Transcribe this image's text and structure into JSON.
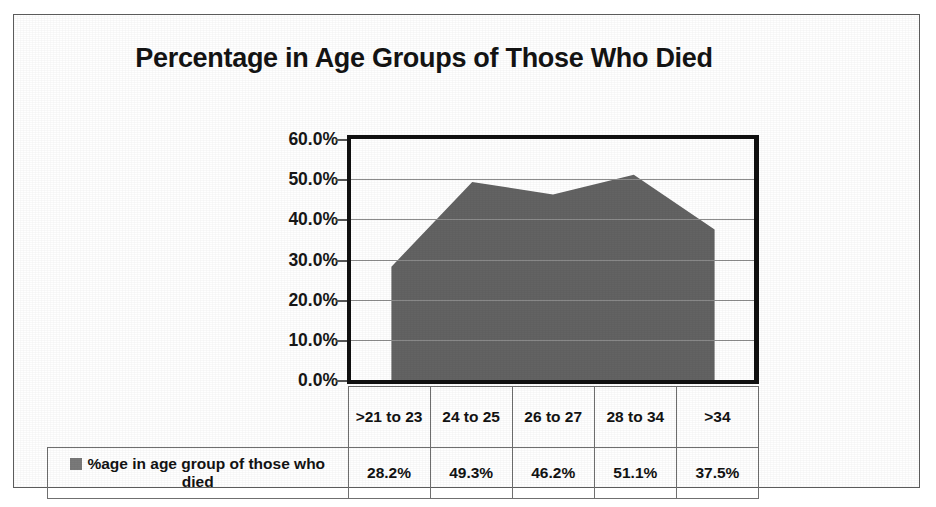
{
  "chart_data": {
    "type": "area",
    "title": "Percentage in Age Groups of Those Who Died",
    "xlabel": "",
    "ylabel": "",
    "categories": [
      ">21 to 23",
      "24 to 25",
      "26 to 27",
      "28 to 34",
      ">34"
    ],
    "values": [
      28.2,
      49.3,
      46.2,
      51.1,
      37.5
    ],
    "value_labels": [
      "28.2%",
      "49.3%",
      "46.2%",
      "51.1%",
      "37.5%"
    ],
    "series": [
      {
        "name": "%age in age group of those who died",
        "values": [
          28.2,
          49.3,
          46.2,
          51.1,
          37.5
        ],
        "color": "#636363"
      }
    ],
    "ylim": [
      0,
      60
    ],
    "ytick_values": [
      60,
      50,
      40,
      30,
      20,
      10,
      0
    ],
    "ytick_labels": [
      "60.0%",
      "50.0%",
      "40.0%",
      "30.0%",
      "20.0%",
      "10.0%",
      "0.0%"
    ],
    "grid": true,
    "legend_position": "data-table",
    "has_data_table": true
  },
  "legend": {
    "series_label": "%age in age group of those who died",
    "swatch_color": "#7a7a7a"
  },
  "colors": {
    "area_fill": "#636363",
    "plot_border": "#111111",
    "gridline": "#8c8c8c",
    "page_border": "#5b5b5b",
    "text": "#141414"
  }
}
